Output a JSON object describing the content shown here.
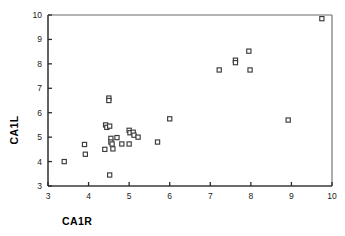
{
  "chart_data": {
    "type": "scatter",
    "title": "",
    "xlabel": "CA1R",
    "ylabel": "CA1L",
    "xlim": [
      3,
      10
    ],
    "ylim": [
      3,
      10
    ],
    "xticks": [
      3,
      4,
      5,
      6,
      7,
      8,
      9,
      10
    ],
    "yticks": [
      3,
      4,
      5,
      6,
      7,
      8,
      9,
      10
    ],
    "grid": false,
    "legend": null,
    "marker": "open-square",
    "marker_color": "#3b3b3b",
    "points": [
      {
        "x": 3.4,
        "y": 4.0
      },
      {
        "x": 3.9,
        "y": 4.7
      },
      {
        "x": 3.92,
        "y": 4.3
      },
      {
        "x": 4.42,
        "y": 5.5
      },
      {
        "x": 4.45,
        "y": 5.4
      },
      {
        "x": 4.4,
        "y": 4.5
      },
      {
        "x": 4.5,
        "y": 6.6
      },
      {
        "x": 4.5,
        "y": 6.5
      },
      {
        "x": 4.52,
        "y": 5.45
      },
      {
        "x": 4.55,
        "y": 4.95
      },
      {
        "x": 4.55,
        "y": 4.8
      },
      {
        "x": 4.58,
        "y": 4.72
      },
      {
        "x": 4.6,
        "y": 4.52
      },
      {
        "x": 4.52,
        "y": 3.45
      },
      {
        "x": 4.7,
        "y": 4.98
      },
      {
        "x": 4.82,
        "y": 4.72
      },
      {
        "x": 5.0,
        "y": 5.28
      },
      {
        "x": 5.02,
        "y": 5.18
      },
      {
        "x": 5.0,
        "y": 4.72
      },
      {
        "x": 5.1,
        "y": 5.2
      },
      {
        "x": 5.12,
        "y": 5.08
      },
      {
        "x": 5.22,
        "y": 5.0
      },
      {
        "x": 5.7,
        "y": 4.8
      },
      {
        "x": 6.0,
        "y": 5.75
      },
      {
        "x": 7.22,
        "y": 7.75
      },
      {
        "x": 7.62,
        "y": 8.15
      },
      {
        "x": 7.62,
        "y": 8.05
      },
      {
        "x": 7.95,
        "y": 8.52
      },
      {
        "x": 7.98,
        "y": 7.75
      },
      {
        "x": 8.92,
        "y": 5.7
      },
      {
        "x": 9.75,
        "y": 9.85
      }
    ]
  },
  "axes": {
    "x_title": "CA1R",
    "y_title": "CA1L",
    "x_tick_labels": [
      "3",
      "4",
      "5",
      "6",
      "7",
      "8",
      "9",
      "10"
    ],
    "y_tick_labels": [
      "3",
      "4",
      "5",
      "6",
      "7",
      "8",
      "9",
      "10"
    ]
  }
}
